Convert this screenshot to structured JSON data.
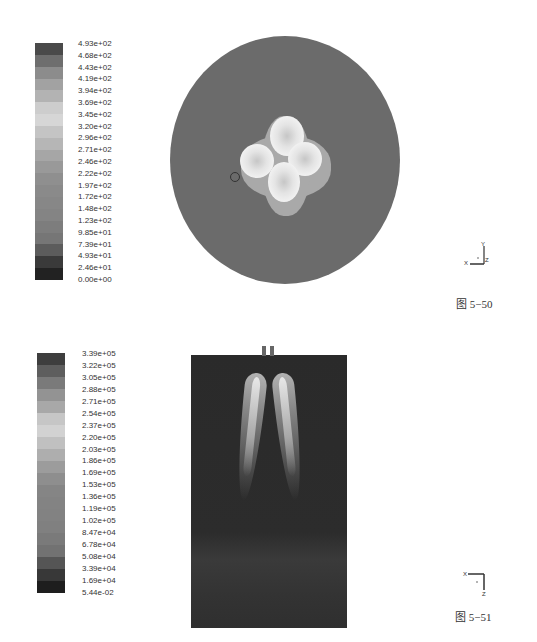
{
  "figures": [
    {
      "id": "fig-5-50",
      "caption": "图 5−50",
      "colorbar": {
        "labels": [
          "4.93e+02",
          "4.68e+02",
          "4.43e+02",
          "4.19e+02",
          "3.94e+02",
          "3.69e+02",
          "3.45e+02",
          "3.20e+02",
          "2.96e+02",
          "2.71e+02",
          "2.46e+02",
          "2.22e+02",
          "1.97e+02",
          "1.72e+02",
          "1.48e+02",
          "1.23e+02",
          "9.85e+01",
          "7.39e+01",
          "4.93e+01",
          "2.46e+01",
          "0.00e+00"
        ],
        "band_colors": [
          "#4a4a4a",
          "#6e6e6e",
          "#8c8c8c",
          "#a2a2a2",
          "#b3b3b3",
          "#cdcdcd",
          "#d6d6d6",
          "#c4c4c4",
          "#b6b6b6",
          "#a6a6a6",
          "#999999",
          "#8f8f8f",
          "#8a8a8a",
          "#878787",
          "#848484",
          "#7d7d7d",
          "#767676",
          "#5c5c5c",
          "#3a3a3a",
          "#222222"
        ]
      },
      "axis_triad": {
        "x": "X",
        "y": "Y",
        "z": "Z"
      },
      "plot": {
        "shape": "circular cross-section",
        "background_color": "#6b6b6b"
      }
    },
    {
      "id": "fig-5-51",
      "caption": "图 5−51",
      "colorbar": {
        "labels": [
          "3.39e+05",
          "3.22e+05",
          "3.05e+05",
          "2.88e+05",
          "2.71e+05",
          "2.54e+05",
          "2.37e+05",
          "2.20e+05",
          "2.03e+05",
          "1.86e+05",
          "1.69e+05",
          "1.53e+05",
          "1.36e+05",
          "1.19e+05",
          "1.02e+05",
          "8.47e+04",
          "6.78e+04",
          "5.08e+04",
          "3.39e+04",
          "1.69e+04",
          "5.44e-02"
        ],
        "band_colors": [
          "#3e3e3e",
          "#5e5e5e",
          "#7a7a7a",
          "#939393",
          "#a8a8a8",
          "#c6c6c6",
          "#d2d2d2",
          "#c0c0c0",
          "#aeaeae",
          "#9c9c9c",
          "#8e8e8e",
          "#858585",
          "#838383",
          "#828282",
          "#808080",
          "#7a7a7a",
          "#727272",
          "#555555",
          "#383838",
          "#1e1e1e"
        ]
      },
      "axis_triad": {
        "x": "X",
        "y": "Y",
        "z": "Z"
      },
      "plot": {
        "shape": "rectangular longitudinal section",
        "background_color": "#2c2c2c"
      }
    }
  ]
}
